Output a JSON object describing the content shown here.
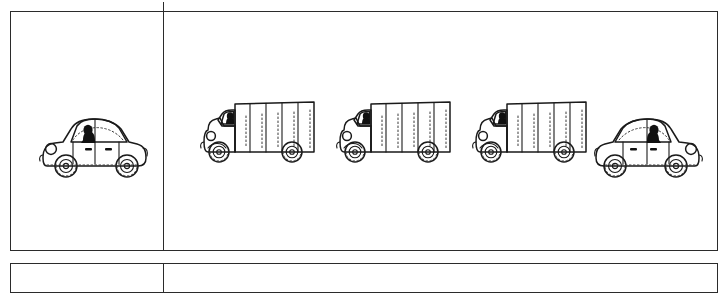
{
  "document": {
    "type": "worksheet-table",
    "background_color": "#ffffff",
    "ink_color": "#1a1a1a",
    "border_color": "#2b2b2b"
  },
  "table": {
    "rows": [
      {
        "name": "row-1",
        "cells": [
          {
            "name": "cell-left",
            "vehicles": [
              {
                "kind": "car",
                "facing": "left",
                "has_driver": true,
                "driver_side": "left"
              }
            ]
          },
          {
            "name": "cell-right",
            "vehicles": [
              {
                "kind": "truck",
                "facing": "left",
                "has_driver": true,
                "cargo_panels": 5
              },
              {
                "kind": "truck",
                "facing": "left",
                "has_driver": true,
                "cargo_panels": 5
              },
              {
                "kind": "truck",
                "facing": "left",
                "has_driver": true,
                "cargo_panels": 5
              },
              {
                "kind": "car",
                "facing": "right",
                "has_driver": true,
                "driver_side": "right"
              }
            ]
          }
        ]
      },
      {
        "name": "row-2",
        "cells": [
          {
            "name": "cell-left",
            "vehicles": []
          },
          {
            "name": "cell-right",
            "vehicles": []
          }
        ]
      }
    ]
  },
  "marks": {
    "top_tick": {
      "name": "column-divider-tick",
      "visible": true
    }
  }
}
